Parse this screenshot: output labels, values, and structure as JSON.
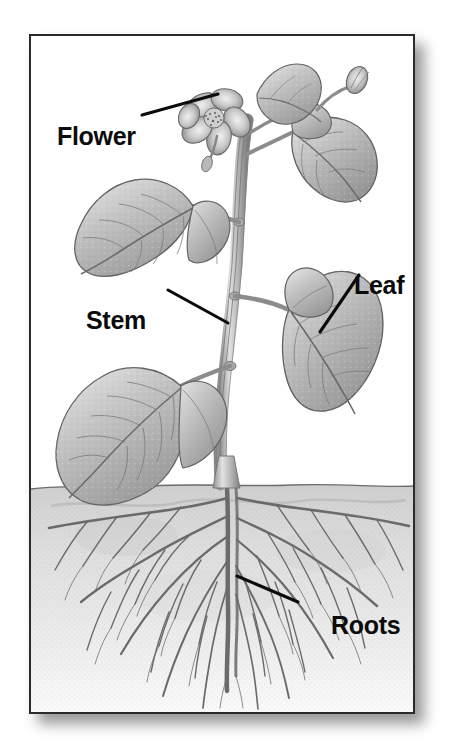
{
  "figure": {
    "kind": "labeled-botanical-diagram",
    "frame": {
      "border_color": "#2b2b2b",
      "background_color": "#ffffff",
      "shadow_color": "#6f6f6f"
    },
    "ink_color": "#0b0b0b",
    "illustration_style": "grayscale engraving / stipple pencil drawing",
    "ground": {
      "soil_line_label": "",
      "soil_fill_color": "#d8d8d8"
    },
    "labels": [
      {
        "id": "flower",
        "text": "Flower",
        "leader": {
          "x1": 140,
          "y1": 113,
          "x2": 216,
          "y2": 92
        }
      },
      {
        "id": "stem",
        "text": "Stem",
        "leader": {
          "x1": 166,
          "y1": 288,
          "x2": 226,
          "y2": 321
        }
      },
      {
        "id": "leaf",
        "text": "Leaf",
        "leader": {
          "x1": 357,
          "y1": 273,
          "x2": 318,
          "y2": 330
        }
      },
      {
        "id": "roots",
        "text": "Roots",
        "leader": {
          "x1": 296,
          "y1": 600,
          "x2": 235,
          "y2": 574
        }
      }
    ],
    "parts": [
      {
        "name": "flower",
        "description": "five-petaled blossom with stippled center at the top of the stem"
      },
      {
        "name": "bud",
        "description": "unopened flower bud on upper right branch"
      },
      {
        "name": "stem",
        "description": "central vertical stalk with nodes"
      },
      {
        "name": "leaf",
        "description": "heart-shaped leaf with central and lateral veins"
      },
      {
        "name": "roots",
        "description": "branching fibrous root system below the soil line"
      }
    ]
  }
}
